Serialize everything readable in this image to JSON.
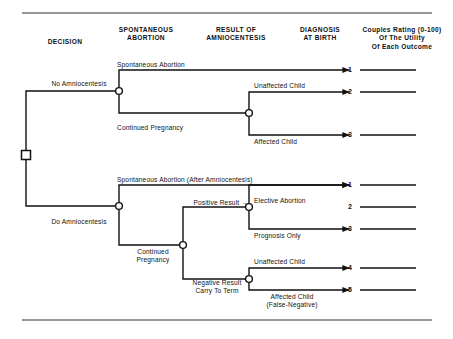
{
  "figure": {
    "rules": {
      "top_y": 13,
      "bottom_y": 320
    }
  },
  "columns": [
    {
      "id": "decision",
      "label": "DECISION",
      "x": 26,
      "y": 38,
      "w": 78
    },
    {
      "id": "spont",
      "label": "SPONTANEOUS\nABORTION",
      "x": 104,
      "y": 26,
      "w": 84
    },
    {
      "id": "result",
      "label": "RESULT OF\nAMNIOCENTESIS",
      "x": 188,
      "y": 26,
      "w": 96
    },
    {
      "id": "diagnosis",
      "label": "DIAGNOSIS\nAT BIRTH",
      "x": 284,
      "y": 26,
      "w": 72
    },
    {
      "id": "rating",
      "label": "Couples Rating (0-100)\nOf The Utility\nOf Each Outcome",
      "x": 352,
      "y": 26,
      "w": 100
    }
  ],
  "nodes": [
    {
      "id": "root",
      "type": "decision",
      "x": 26,
      "y": 155
    },
    {
      "id": "no-amnio-chance",
      "type": "chance",
      "x": 119,
      "y": 91
    },
    {
      "id": "birth-no-amnio",
      "type": "chance",
      "x": 249,
      "y": 113
    },
    {
      "id": "do-amnio-chance",
      "type": "chance",
      "x": 119,
      "y": 206
    },
    {
      "id": "amnio-result",
      "type": "chance",
      "x": 183,
      "y": 245
    },
    {
      "id": "positive-chance",
      "type": "chance",
      "x": 249,
      "y": 207
    },
    {
      "id": "negative-chance",
      "type": "chance",
      "x": 249,
      "y": 279
    }
  ],
  "edge_labels": [
    {
      "id": "no-amniocentesis",
      "text": "No Amniocentesis",
      "x": 40,
      "y": 80,
      "w": 78,
      "align": "center"
    },
    {
      "id": "do-amniocentesis",
      "text": "Do Amniocentesis",
      "x": 40,
      "y": 218,
      "w": 78,
      "align": "center"
    },
    {
      "id": "spontaneous-abortion",
      "text": "Spontaneous Abortion",
      "x": 117,
      "y": 61,
      "w": 100,
      "align": "left"
    },
    {
      "id": "continued-pregnancy-1",
      "text": "Continued Pregnancy",
      "x": 117,
      "y": 124,
      "w": 100,
      "align": "left"
    },
    {
      "id": "unaffected-child-1",
      "text": "Unaffected Child",
      "x": 254,
      "y": 82,
      "w": 70,
      "align": "left"
    },
    {
      "id": "affected-child-1",
      "text": "Affected Child",
      "x": 254,
      "y": 138,
      "w": 70,
      "align": "left"
    },
    {
      "id": "spont-after-amnio",
      "text": "Spontaneous Abortion (After Amniocentesis)",
      "x": 117,
      "y": 176,
      "w": 200,
      "align": "left"
    },
    {
      "id": "continued-pregnancy-2",
      "text": "Continued\nPregnancy",
      "x": 126,
      "y": 248,
      "w": 54,
      "align": "center"
    },
    {
      "id": "positive-result",
      "text": "Positive Result →",
      "x": 182,
      "y": 199,
      "w": 66,
      "align": "right"
    },
    {
      "id": "elective-abortion",
      "text": "Elective Abortion",
      "x": 254,
      "y": 197,
      "w": 70,
      "align": "left"
    },
    {
      "id": "prognosis-only",
      "text": "Prognosis Only",
      "x": 254,
      "y": 232,
      "w": 70,
      "align": "left"
    },
    {
      "id": "negative-result",
      "text": "Negative Result\nCarry To Term",
      "x": 183,
      "y": 279,
      "w": 68,
      "align": "center"
    },
    {
      "id": "unaffected-child-2",
      "text": "Unaffected Child",
      "x": 254,
      "y": 258,
      "w": 70,
      "align": "left"
    },
    {
      "id": "affected-child-2",
      "text": "Affected Child\n(False-Negative)",
      "x": 252,
      "y": 293,
      "w": 80,
      "align": "center"
    }
  ],
  "outcomes": [
    {
      "id": "outcome-1-top",
      "number": "1",
      "arrow_y": 70,
      "num_x": 352,
      "line_x1": 360,
      "line_x2": 416
    },
    {
      "id": "outcome-2-top",
      "number": "2",
      "arrow_y": 92,
      "num_x": 352,
      "line_x1": 360,
      "line_x2": 416
    },
    {
      "id": "outcome-3-top",
      "number": "3",
      "arrow_y": 135,
      "num_x": 352,
      "line_x1": 360,
      "line_x2": 416
    },
    {
      "id": "outcome-1-bot",
      "number": "1",
      "arrow_y": 185,
      "num_x": 352,
      "line_x1": 360,
      "line_x2": 416
    },
    {
      "id": "outcome-2-bot",
      "number": "2",
      "arrow_y": 207,
      "num_x": 352,
      "line_x1": 360,
      "line_x2": 416
    },
    {
      "id": "outcome-3-bot",
      "number": "3",
      "arrow_y": 229,
      "num_x": 352,
      "line_x1": 360,
      "line_x2": 416
    },
    {
      "id": "outcome-4-bot",
      "number": "4",
      "arrow_y": 268,
      "num_x": 352,
      "line_x1": 360,
      "line_x2": 416
    },
    {
      "id": "outcome-5-bot",
      "number": "5",
      "arrow_y": 290,
      "num_x": 352,
      "line_x1": 360,
      "line_x2": 416
    }
  ],
  "colors": {
    "ink": "#111111",
    "background": "#ffffff",
    "rule": "#333333"
  }
}
